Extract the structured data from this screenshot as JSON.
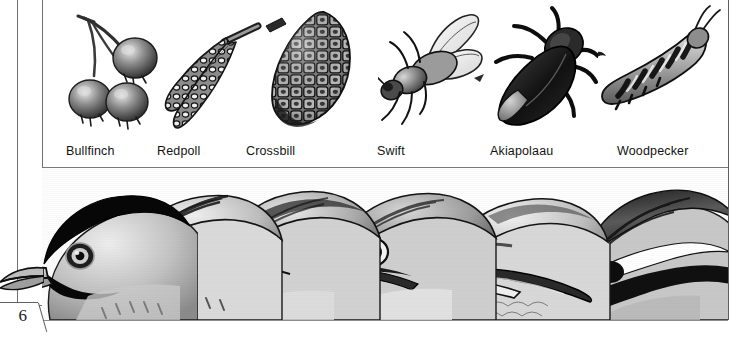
{
  "page": {
    "folio_number": "6",
    "background_color": "#ffffff",
    "ink_color": "#131313",
    "rule_color": "#6f7274"
  },
  "figure": {
    "caption_font_size": "12.5px",
    "columns": [
      {
        "label": "Bullfinch",
        "label_x": 66,
        "food_icon": "berries-icon",
        "food_name": "berries",
        "head_icon": "bullfinch-head-icon",
        "food_x": 22,
        "head_x": -44
      },
      {
        "label": "Redpoll",
        "label_x": 157,
        "food_icon": "catkins-icon",
        "food_name": "birch catkins",
        "head_icon": "redpoll-head-icon",
        "food_x": 112,
        "head_x": 68
      },
      {
        "label": "Crossbill",
        "label_x": 246,
        "food_icon": "pine-cone-icon",
        "food_name": "pine cone",
        "head_icon": "crossbill-head-icon",
        "food_x": 222,
        "head_x": 158
      },
      {
        "label": "Swift",
        "label_x": 377,
        "food_icon": "fly-icon",
        "food_name": "fly",
        "head_icon": "swift-head-icon",
        "food_x": 336,
        "head_x": 270
      },
      {
        "label": "Akiapolaau",
        "label_x": 490,
        "food_icon": "beetle-icon",
        "food_name": "beetle",
        "head_icon": "akiapolaau-head-icon",
        "food_x": 446,
        "head_x": 386
      },
      {
        "label": "Woodpecker",
        "label_x": 617,
        "food_icon": "caterpillar-icon",
        "food_name": "caterpillar",
        "head_icon": "woodpecker-head-icon",
        "food_x": 556,
        "head_x": 528
      }
    ]
  }
}
